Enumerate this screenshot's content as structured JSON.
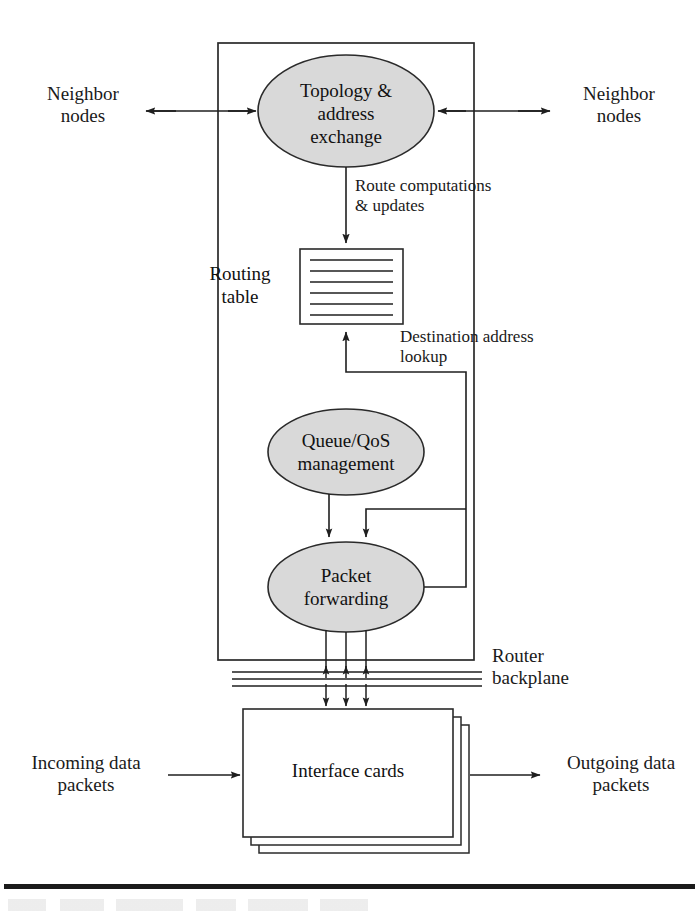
{
  "figure": {
    "type": "block-diagram",
    "background_color": "#ffffff",
    "ink_color": "#1a1a1a",
    "node_fill_color": "#d9d9d9",
    "node_stroke_color": "#2a2a2a"
  },
  "nodes": {
    "topology": {
      "shape": "ellipse",
      "label": "Topology &\naddress\nexchange",
      "cx": 346,
      "cy": 111,
      "rx": 88,
      "ry": 56
    },
    "routing_table": {
      "shape": "rectangle",
      "label": "Routing\ntable",
      "x": 300,
      "y": 249,
      "width": 103,
      "height": 75,
      "row_count": 6
    },
    "queue_qos": {
      "shape": "ellipse",
      "label": "Queue/QoS\nmanagement",
      "cx": 346,
      "cy": 452,
      "rx": 78,
      "ry": 43
    },
    "packet_forwarding": {
      "shape": "ellipse",
      "label": "Packet\nforwarding",
      "cx": 346,
      "cy": 587,
      "rx": 78,
      "ry": 45
    },
    "interface_cards": {
      "shape": "stacked-rectangle",
      "label": "Interface cards",
      "x": 243,
      "y": 709,
      "width": 210,
      "height": 128,
      "stack_count": 3
    }
  },
  "containers": {
    "router_box": {
      "label": "",
      "x": 218,
      "y": 43,
      "width": 256,
      "height": 617
    },
    "backplane": {
      "label": "Router\nbackplane",
      "line_count": 3,
      "x": 232,
      "y": 672,
      "width": 250
    }
  },
  "edge_labels": {
    "route_computations": "Route computations\n& updates",
    "destination_lookup": "Destination address\nlookup"
  },
  "external_labels": {
    "neighbor_nodes_left": "Neighbor\nnodes",
    "neighbor_nodes_right": "Neighbor\nnodes",
    "incoming_packets": "Incoming data\npackets",
    "outgoing_packets": "Outgoing data\npackets",
    "router_backplane": "Router\nbackplane"
  },
  "connections": [
    {
      "name": "neighbor-left-to-topology",
      "from": "neighbor_nodes_left",
      "to": "topology",
      "direction": "bidirectional"
    },
    {
      "name": "neighbor-right-to-topology",
      "from": "neighbor_nodes_right",
      "to": "topology",
      "direction": "bidirectional"
    },
    {
      "name": "topology-to-routing-table",
      "from": "topology",
      "to": "routing_table",
      "direction": "down",
      "label": "Route computations\n& updates"
    },
    {
      "name": "packet-forwarding-to-routing-table",
      "from": "packet_forwarding",
      "to": "routing_table",
      "direction": "up",
      "label": "Destination address\nlookup"
    },
    {
      "name": "queue-qos-to-packet-forwarding",
      "from": "queue_qos",
      "to": "packet_forwarding",
      "direction": "down"
    },
    {
      "name": "packet-forwarding-to-backplane",
      "from": "packet_forwarding",
      "to": "interface_cards",
      "direction": "bidirectional",
      "arrow_count": 3
    },
    {
      "name": "incoming-to-interface-cards",
      "from": "incoming_packets",
      "to": "interface_cards",
      "direction": "right"
    },
    {
      "name": "interface-cards-to-outgoing",
      "from": "interface_cards",
      "to": "outgoing_packets",
      "direction": "right"
    }
  ]
}
